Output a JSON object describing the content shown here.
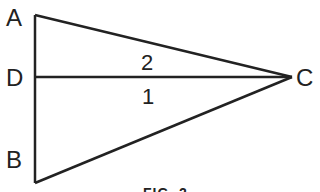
{
  "figure": {
    "vertices": {
      "A": "A",
      "D": "D",
      "B": "B",
      "C": "C"
    },
    "angle_labels": {
      "upper": "2",
      "lower": "1"
    },
    "caption": "FIG. 2",
    "stroke_color": "#222222",
    "background": "#ffffff"
  }
}
